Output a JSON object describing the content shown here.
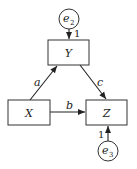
{
  "diagram": {
    "type": "path-diagram",
    "nodes": {
      "Y": {
        "label": "Y"
      },
      "X": {
        "label": "X"
      },
      "Z": {
        "label": "Z"
      },
      "e2": {
        "label": "e",
        "subscript": "2"
      },
      "e3": {
        "label": "e",
        "subscript": "3"
      }
    },
    "edges": [
      {
        "from": "X",
        "to": "Y",
        "label": "a"
      },
      {
        "from": "X",
        "to": "Z",
        "label": "b"
      },
      {
        "from": "Y",
        "to": "Z",
        "label": "c"
      },
      {
        "from": "e2",
        "to": "Y",
        "label": "1"
      },
      {
        "from": "e3",
        "to": "Z",
        "label": "1"
      }
    ]
  }
}
